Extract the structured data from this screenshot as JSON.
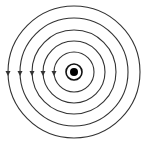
{
  "diagram": {
    "center": {
      "x": 74,
      "y": 72
    },
    "stroke_color": "#333333",
    "wire": {
      "dot_radius": 4,
      "ring_radius": 8
    },
    "field_lines": [
      {
        "radius": 20,
        "arrow": "down"
      },
      {
        "radius": 31,
        "arrow": "down"
      },
      {
        "radius": 42,
        "arrow": "down"
      },
      {
        "radius": 54,
        "arrow": "down"
      },
      {
        "radius": 66,
        "arrow": "down"
      }
    ]
  }
}
